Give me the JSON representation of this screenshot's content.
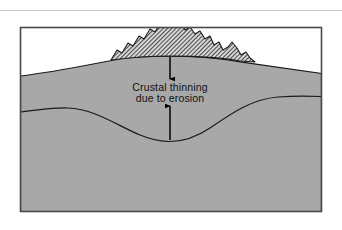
{
  "figure": {
    "name": "crustal-thinning-erosion-diagram",
    "background_color": "#ffffff",
    "top_rule": {
      "name": "top-divider-rule",
      "color": "#c9c9c9",
      "y": 10,
      "x1": 0,
      "x2": 342
    },
    "frame": {
      "name": "diagram-frame",
      "x": 20,
      "y": 27,
      "width": 302,
      "height": 185,
      "border_color": "#4a4a4a",
      "fill_color": "#ffffff"
    },
    "crust": {
      "name": "crust-body",
      "fill_color": "#a8a8a8",
      "outline_color": "#1a1a1a",
      "label": "crust"
    },
    "mountain": {
      "name": "mountain-range",
      "fill_pattern": "diagonal-hatch",
      "hatch_color": "#1a1a1a",
      "hatch_background": "#d8d8d8",
      "outline_color": "#1a1a1a",
      "label": "eroding mountain range",
      "peak_x": 170,
      "peak_y": 15
    },
    "moho": {
      "name": "moho-boundary-curve",
      "color": "#1a1a1a",
      "label": "crust-mantle boundary"
    },
    "annotation": {
      "name": "crustal-thinning-annotation",
      "line1": "Crustal  thinning",
      "line2": "due to erosion",
      "text_color": "#101010",
      "arrow_color": "#000000",
      "arrow_down": {
        "name": "arrow-down-surface",
        "x": 170,
        "y_start": 57,
        "y_end": 81
      },
      "arrow_up": {
        "name": "arrow-up-moho",
        "x": 170,
        "y_start": 140,
        "y_end": 104
      }
    }
  }
}
